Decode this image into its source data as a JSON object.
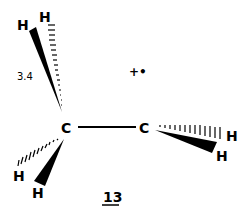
{
  "diagram": {
    "type": "chemical-structure",
    "compound_label": "13",
    "annotation": "3.4",
    "radical_marker": "+•",
    "atoms": [
      {
        "id": "C1",
        "label": "C"
      },
      {
        "id": "C2",
        "label": "C"
      },
      {
        "id": "H1",
        "label": "H"
      },
      {
        "id": "H2",
        "label": "H"
      },
      {
        "id": "H3",
        "label": "H"
      },
      {
        "id": "H4",
        "label": "H"
      },
      {
        "id": "H5",
        "label": "H"
      },
      {
        "id": "H6",
        "label": "H"
      }
    ],
    "bonds": [
      {
        "from": "C1",
        "to": "C2",
        "style": "single"
      },
      {
        "from": "C1",
        "to": "H1",
        "style": "wedge"
      },
      {
        "from": "C1",
        "to": "H2",
        "style": "hash"
      },
      {
        "from": "C1",
        "to": "H3",
        "style": "hash"
      },
      {
        "from": "C1",
        "to": "H4",
        "style": "wedge"
      },
      {
        "from": "C2",
        "to": "H5",
        "style": "hash"
      },
      {
        "from": "C2",
        "to": "H6",
        "style": "wedge"
      }
    ]
  }
}
